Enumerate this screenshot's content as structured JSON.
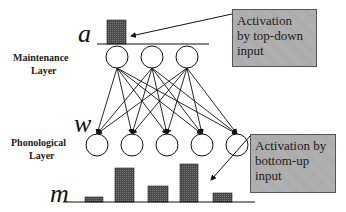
{
  "labels": {
    "maintenance_layer": [
      "Maintenance",
      "Layer"
    ],
    "phonological_layer": [
      "Phonological",
      "Layer"
    ],
    "var_a": "a",
    "var_w": "w",
    "var_m": "m"
  },
  "callouts": {
    "top_down": [
      "Activation",
      "by top-down",
      "input"
    ],
    "bottom_up": [
      "Activation by",
      "bottom-up",
      "input"
    ]
  },
  "colors": {
    "bar_fill": "#555555",
    "callout_fill": "#a9a9a9",
    "line": "#111111"
  },
  "maintenance_nodes": 3,
  "phonological_nodes": 5,
  "activation_a": {
    "bar_height_px": 24
  },
  "activation_m": {
    "bar_heights_px": [
      5,
      34,
      16,
      38,
      9
    ]
  }
}
